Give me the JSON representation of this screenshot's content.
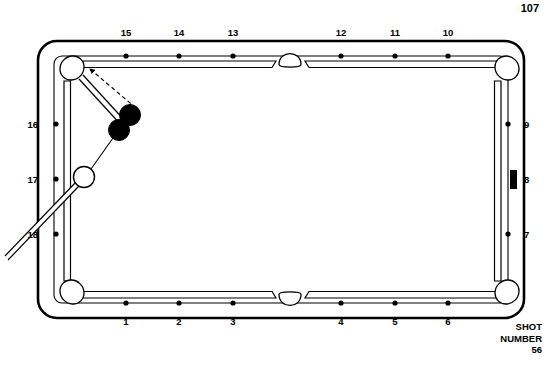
{
  "page": {
    "number": "107"
  },
  "caption": {
    "line1": "SHOT",
    "line2": "NUMBER",
    "line3": "56"
  },
  "diagram": {
    "type": "billiards-shot-diagram",
    "colors": {
      "ink": "#000000",
      "cloth": "#ffffff",
      "object_ball": "#000000",
      "cue_ball": "#ffffff"
    },
    "table": {
      "outer_left": 38,
      "outer_top": 41,
      "outer_right": 524,
      "outer_bottom": 318,
      "corner_radius": 17,
      "cushion_inset": 17
    },
    "diamond_labels": {
      "top": [
        "15",
        "14",
        "13",
        "12",
        "11",
        "10"
      ],
      "bottom": [
        "1",
        "2",
        "3",
        "4",
        "5",
        "6"
      ],
      "left": [
        "16",
        "17",
        "18"
      ],
      "right": [
        "9",
        "8",
        "7"
      ]
    },
    "diamonds": {
      "top_x": [
        126,
        179,
        233,
        341,
        395,
        448
      ],
      "bottom_x": [
        126,
        179,
        233,
        341,
        395,
        448
      ],
      "side_y": [
        124,
        179,
        234
      ],
      "top_y": 60,
      "bottom_y": 299,
      "left_x": 54,
      "right_x": 508
    },
    "marker": {
      "name": "rail-marker-8",
      "side": "right",
      "at_label": "8",
      "x": 513,
      "y": 179,
      "width": 7,
      "height": 18
    },
    "pockets": [
      {
        "name": "pocket-top-left",
        "cx": 72,
        "cy": 68,
        "r": 12
      },
      {
        "name": "pocket-top-side",
        "cx": 290,
        "cy": 62,
        "r": 11
      },
      {
        "name": "pocket-top-right",
        "cx": 507,
        "cy": 68,
        "r": 12
      },
      {
        "name": "pocket-bottom-left",
        "cx": 72,
        "cy": 293,
        "r": 12
      },
      {
        "name": "pocket-bottom-side",
        "cx": 290,
        "cy": 297,
        "r": 11
      },
      {
        "name": "pocket-bottom-right",
        "cx": 507,
        "cy": 293,
        "r": 12
      }
    ],
    "balls": [
      {
        "name": "object-ball-1",
        "type": "object",
        "cx": 130,
        "cy": 115,
        "r": 10.5,
        "fill": "#000000"
      },
      {
        "name": "object-ball-2",
        "type": "object",
        "cx": 119,
        "cy": 130,
        "r": 10.5,
        "fill": "#000000"
      },
      {
        "name": "cue-ball",
        "type": "cue",
        "cx": 84,
        "cy": 177,
        "r": 10.5,
        "fill": "#ffffff"
      }
    ],
    "paths": [
      {
        "name": "cue-ball-to-object-line",
        "style": "solid-thin",
        "from": [
          84,
          177
        ],
        "to": [
          117,
          132
        ]
      },
      {
        "name": "object-ball-to-pocket-solid-arrow",
        "style": "solid-double",
        "from": [
          124,
          123
        ],
        "to": [
          80,
          73
        ]
      },
      {
        "name": "object-ball-to-pocket-dashed-arrow",
        "style": "dashed",
        "from": [
          134,
          110
        ],
        "to": [
          87,
          68
        ]
      }
    ],
    "cue_stick": {
      "name": "cue-stick",
      "tip": [
        77,
        186
      ],
      "butt": [
        6,
        259
      ],
      "width": 4.5,
      "arrow_mark_at": [
        33,
        236
      ]
    }
  }
}
